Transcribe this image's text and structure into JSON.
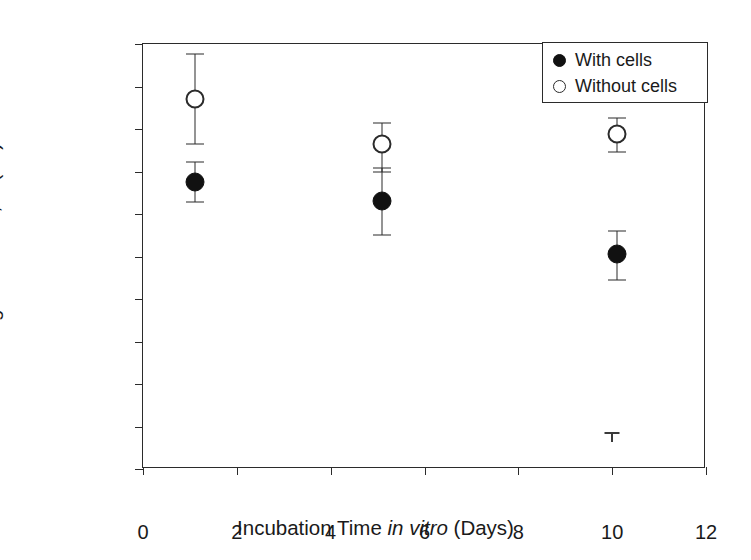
{
  "chart_data": {
    "type": "scatter",
    "title": "",
    "xlabel": "Incubation Time in vitro (Days)",
    "xlabel_parts": {
      "pre": "Incubation Time ",
      "italic": "in vitro",
      "post": " (Days)"
    },
    "ylabel": "Young's Modulus, E (Pa)",
    "xlim": [
      0,
      12
    ],
    "ylim": [
      0,
      10000
    ],
    "xticks": [
      0,
      2,
      4,
      6,
      8,
      10,
      12
    ],
    "xtick_labels": [
      "0",
      "2",
      "4",
      "6",
      "8",
      "10",
      "12"
    ],
    "yticks": [
      0,
      1000,
      2000,
      3000,
      4000,
      5000,
      6000,
      7000,
      8000,
      9000,
      10000
    ],
    "ytick_labels": [
      "0",
      "1,000",
      "2,000",
      "3,000",
      "4,000",
      "5,000",
      "6,000",
      "7,000",
      "8,000",
      "9,000",
      "10,000"
    ],
    "grid": false,
    "frame": true,
    "legend_position": "top-right",
    "marker_color": "#111111",
    "axis_color": "#2b2b2b",
    "series": [
      {
        "name": "With cells",
        "marker": "filled-circle",
        "x": [
          1.1,
          5.1,
          10.1
        ],
        "values": [
          6750,
          6300,
          5050
        ],
        "err_low": [
          6280,
          5500,
          4450
        ],
        "err_high": [
          7220,
          7080,
          5600
        ]
      },
      {
        "name": "Without cells",
        "marker": "open-circle",
        "x": [
          1.1,
          5.1,
          10.1
        ],
        "values": [
          8700,
          7650,
          7880
        ],
        "err_low": [
          7650,
          7000,
          7450
        ],
        "err_high": [
          9760,
          8150,
          8250
        ]
      }
    ],
    "annotations": [
      {
        "name": "stray-error-cap",
        "x": 10.0,
        "y": 850,
        "label": ""
      }
    ]
  },
  "legend": {
    "entries": [
      {
        "label": "With cells",
        "marker": "filled-circle"
      },
      {
        "label": "Without cells",
        "marker": "open-circle"
      }
    ]
  }
}
